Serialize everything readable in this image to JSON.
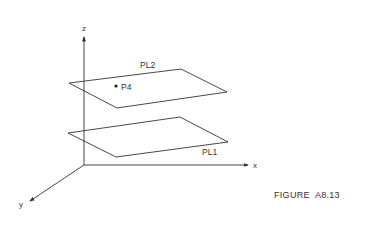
{
  "diagram": {
    "axes": {
      "z_label": "z",
      "x_label": "x",
      "y_label": "y"
    },
    "planes": [
      {
        "id": "upper",
        "label": "PL2"
      },
      {
        "id": "lower",
        "label": "PL1"
      }
    ],
    "points": [
      {
        "label": "P4"
      }
    ]
  },
  "caption": "FIGURE  A8.13",
  "colors": {
    "stroke": "#333333",
    "background": "#ffffff"
  }
}
